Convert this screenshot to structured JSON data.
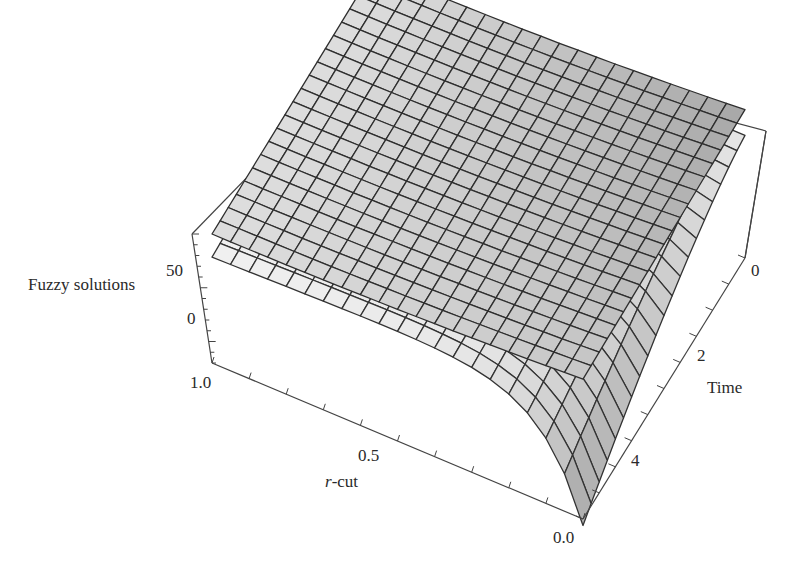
{
  "chart_data": {
    "type": "surface3d",
    "title": "",
    "zlabel": "Fuzzy solutions",
    "xlabel": "r-cut",
    "ylabel": "Time",
    "z_ticks": [
      "50",
      "0"
    ],
    "x_ticks": [
      "1.0",
      "0.5",
      "0.0"
    ],
    "y_ticks": [
      "0",
      "2",
      "4"
    ],
    "x_range": [
      0.0,
      1.0
    ],
    "y_range": [
      0,
      5
    ],
    "grid": "mesh 20x20",
    "series": [
      {
        "name": "upper bound solution",
        "shade": "#b8b8b8",
        "description": "slowly varying surface near z≈50–60, rising slightly toward r=0"
      },
      {
        "name": "lower bound solution",
        "shade": "#e6e6e6",
        "description": "surface near z≈40–50 that drops sharply toward negative values as r→0 and Time→5"
      }
    ]
  },
  "labels": {
    "z_axis": "Fuzzy solutions",
    "z_tick_50": "50",
    "z_tick_0": "0",
    "x_axis_prefix": "r",
    "x_axis_suffix": "-cut",
    "x_tick_1": "1.0",
    "x_tick_05": "0.5",
    "x_tick_0": "0.0",
    "y_axis": "Time",
    "y_tick_0": "0",
    "y_tick_2": "2",
    "y_tick_4": "4"
  }
}
